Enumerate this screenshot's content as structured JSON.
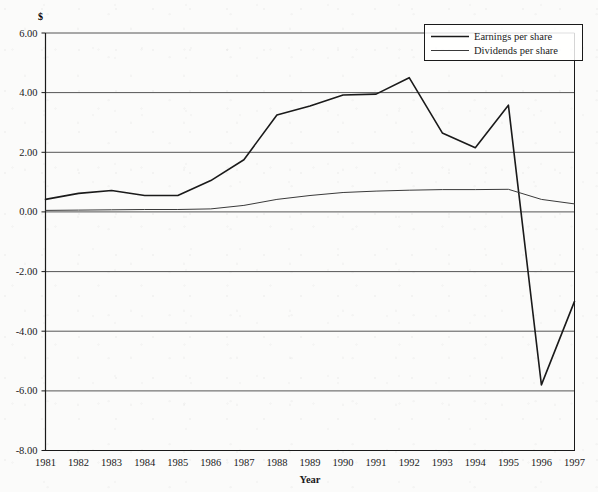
{
  "chart_data": {
    "type": "line",
    "title": "",
    "xlabel": "Year",
    "ylabel": "$",
    "y_unit_symbol": "$",
    "categories": [
      1981,
      1982,
      1983,
      1984,
      1985,
      1986,
      1987,
      1988,
      1989,
      1990,
      1991,
      1992,
      1993,
      1994,
      1995,
      1996,
      1997
    ],
    "x_tick_labels": [
      "1981",
      "1982",
      "1983",
      "1984",
      "1985",
      "1986",
      "1987",
      "1988",
      "1989",
      "1990",
      "1991",
      "1992",
      "1993",
      "1994",
      "1995",
      "1996",
      "1997"
    ],
    "y_tick_labels": [
      "6.00",
      "4.00",
      "2.00",
      "0.00",
      "-2.00",
      "-4.00",
      "-6.00",
      "-8.00"
    ],
    "y_tick_values": [
      6.0,
      4.0,
      2.0,
      0.0,
      -2.0,
      -4.0,
      -6.0,
      -8.0
    ],
    "ylim": [
      -8.0,
      6.0
    ],
    "xlim": [
      1981,
      1997
    ],
    "grid": "horizontal",
    "legend_position": "top-right",
    "series": [
      {
        "name": "Earnings per share",
        "color": "#1a1a1a",
        "values": [
          0.42,
          0.62,
          0.72,
          0.55,
          0.55,
          1.05,
          1.75,
          3.25,
          3.55,
          3.92,
          3.95,
          4.5,
          2.65,
          2.15,
          3.58,
          -5.8,
          -3.0
        ]
      },
      {
        "name": "Dividends per share",
        "color": "#3a3a3a",
        "values": [
          0.05,
          0.06,
          0.07,
          0.08,
          0.08,
          0.1,
          0.22,
          0.42,
          0.55,
          0.65,
          0.7,
          0.73,
          0.75,
          0.75,
          0.76,
          0.42,
          0.27
        ]
      }
    ]
  },
  "legend": {
    "entries": [
      {
        "label": "Earnings per share"
      },
      {
        "label": "Dividends per share"
      }
    ]
  },
  "colors": {
    "axis": "#1a1a1a",
    "grid": "#555555",
    "series_1": "#1a1a1a",
    "series_2": "#3a3a3a",
    "background": "#fbfbfa"
  }
}
